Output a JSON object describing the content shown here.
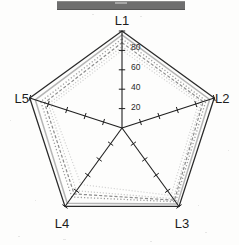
{
  "header": {
    "bar_label": ""
  },
  "chart_data": {
    "type": "radar",
    "title": "",
    "xlabel": "",
    "ylabel": "",
    "categories": [
      "L1",
      "L2",
      "L3",
      "L4",
      "L5"
    ],
    "tick_values": [
      20,
      40,
      60,
      80
    ],
    "tick_labels": [
      "20",
      "40",
      "60",
      "80"
    ],
    "rlim": [
      0,
      100
    ],
    "grid": false,
    "axis_ticks_per_axis": 5,
    "legend": "none",
    "legend_position": "none",
    "series": [
      {
        "name": "Series 1",
        "style": "solid",
        "color": "#2b2b2b",
        "width": 1.3,
        "values": [
          100,
          100,
          100,
          100,
          100
        ]
      },
      {
        "name": "Series 2",
        "style": "solid",
        "color": "#b5b5b5",
        "width": 1.5,
        "values": [
          96,
          95,
          97,
          96,
          94
        ]
      },
      {
        "name": "Series 3",
        "style": "dotted",
        "color": "#9a9a9a",
        "width": 1.3,
        "values": [
          92,
          91,
          94,
          88,
          88
        ]
      },
      {
        "name": "Series 4",
        "style": "dashed",
        "color": "#8c8c8c",
        "width": 1.2,
        "values": [
          88,
          88,
          92,
          84,
          84
        ]
      },
      {
        "name": "Series 5",
        "style": "dotted",
        "color": "#c4c4c4",
        "width": 1.2,
        "values": [
          84,
          86,
          90,
          80,
          80
        ]
      },
      {
        "name": "Series 6",
        "style": "dotted",
        "color": "#d2d2d2",
        "width": 1.2,
        "values": [
          80,
          83,
          86,
          72,
          77
        ]
      }
    ],
    "geometry": {
      "cx": 122,
      "cy": 128,
      "radius": 97,
      "start_angle_deg": -90
    }
  },
  "labels": {
    "l1": "L1",
    "l2": "L2",
    "l3": "L3",
    "l4": "L4",
    "l5": "L5"
  },
  "ticks": {
    "t20": "20",
    "t40": "40",
    "t60": "60",
    "t80": "80"
  }
}
